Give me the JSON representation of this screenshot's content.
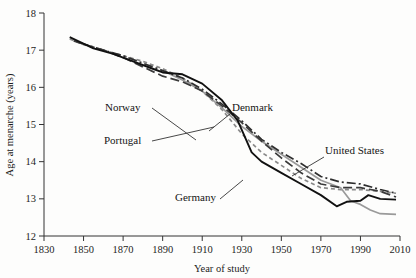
{
  "chart_data": {
    "type": "line",
    "title": "",
    "xlabel": "Year of study",
    "ylabel": "Age at menarche (years)",
    "xlim": [
      1830,
      2010
    ],
    "ylim": [
      12,
      18
    ],
    "xticks": [
      1830,
      1850,
      1870,
      1890,
      1910,
      1930,
      1950,
      1970,
      1990,
      2010
    ],
    "yticks": [
      12,
      13,
      14,
      15,
      16,
      17,
      18
    ],
    "grid": false,
    "legend_position": "inline-annotations",
    "series": [
      {
        "name": "Norway",
        "style": "short-dash",
        "color": "#8a8a8a",
        "label_x": 1870,
        "label_y": 15.05,
        "points": [
          {
            "x": 1843,
            "y": 17.3
          },
          {
            "x": 1850,
            "y": 17.15
          },
          {
            "x": 1860,
            "y": 17.0
          },
          {
            "x": 1870,
            "y": 16.85
          },
          {
            "x": 1880,
            "y": 16.7
          },
          {
            "x": 1890,
            "y": 16.5
          },
          {
            "x": 1900,
            "y": 16.25
          },
          {
            "x": 1910,
            "y": 15.9
          },
          {
            "x": 1920,
            "y": 15.4
          },
          {
            "x": 1930,
            "y": 14.75
          },
          {
            "x": 1940,
            "y": 14.25
          },
          {
            "x": 1950,
            "y": 13.9
          },
          {
            "x": 1960,
            "y": 13.55
          },
          {
            "x": 1970,
            "y": 13.3
          },
          {
            "x": 1980,
            "y": 13.25
          },
          {
            "x": 1990,
            "y": 13.25
          },
          {
            "x": 2000,
            "y": 13.2
          },
          {
            "x": 2008,
            "y": 13.15
          }
        ]
      },
      {
        "name": "Portugal",
        "style": "solid-gray",
        "color": "#9a9a9a",
        "label_x": 1868,
        "label_y": 14.55,
        "points": [
          {
            "x": 1890,
            "y": 16.45
          },
          {
            "x": 1900,
            "y": 16.2
          },
          {
            "x": 1910,
            "y": 15.9
          },
          {
            "x": 1920,
            "y": 15.45
          },
          {
            "x": 1930,
            "y": 14.95
          },
          {
            "x": 1940,
            "y": 14.55
          },
          {
            "x": 1950,
            "y": 14.2
          },
          {
            "x": 1960,
            "y": 13.85
          },
          {
            "x": 1970,
            "y": 13.5
          },
          {
            "x": 1975,
            "y": 13.4
          },
          {
            "x": 1980,
            "y": 13.3
          },
          {
            "x": 1985,
            "y": 12.95
          },
          {
            "x": 1990,
            "y": 12.85
          },
          {
            "x": 1995,
            "y": 12.7
          },
          {
            "x": 2000,
            "y": 12.6
          },
          {
            "x": 2008,
            "y": 12.58
          }
        ]
      },
      {
        "name": "Denmark",
        "style": "dash-dot",
        "color": "#2e2e2e",
        "label_x": 1925,
        "label_y": 15.05,
        "points": [
          {
            "x": 1848,
            "y": 17.2
          },
          {
            "x": 1860,
            "y": 17.0
          },
          {
            "x": 1870,
            "y": 16.85
          },
          {
            "x": 1880,
            "y": 16.65
          },
          {
            "x": 1890,
            "y": 16.45
          },
          {
            "x": 1900,
            "y": 16.25
          },
          {
            "x": 1910,
            "y": 15.95
          },
          {
            "x": 1920,
            "y": 15.55
          },
          {
            "x": 1930,
            "y": 15.1
          },
          {
            "x": 1940,
            "y": 14.6
          },
          {
            "x": 1950,
            "y": 14.25
          },
          {
            "x": 1960,
            "y": 13.95
          },
          {
            "x": 1970,
            "y": 13.6
          },
          {
            "x": 1980,
            "y": 13.45
          },
          {
            "x": 1990,
            "y": 13.4
          },
          {
            "x": 2000,
            "y": 13.25
          },
          {
            "x": 2008,
            "y": 13.15
          }
        ]
      },
      {
        "name": "United States",
        "style": "long-dash",
        "color": "#3a3a3a",
        "label_x": 1975,
        "label_y": 14.3,
        "points": [
          {
            "x": 1845,
            "y": 17.25
          },
          {
            "x": 1860,
            "y": 17.0
          },
          {
            "x": 1870,
            "y": 16.8
          },
          {
            "x": 1880,
            "y": 16.55
          },
          {
            "x": 1890,
            "y": 16.3
          },
          {
            "x": 1900,
            "y": 16.15
          },
          {
            "x": 1910,
            "y": 15.9
          },
          {
            "x": 1920,
            "y": 15.5
          },
          {
            "x": 1930,
            "y": 15.05
          },
          {
            "x": 1940,
            "y": 14.55
          },
          {
            "x": 1950,
            "y": 14.1
          },
          {
            "x": 1960,
            "y": 13.7
          },
          {
            "x": 1970,
            "y": 13.4
          },
          {
            "x": 1980,
            "y": 13.3
          },
          {
            "x": 1990,
            "y": 13.3
          },
          {
            "x": 2000,
            "y": 13.2
          },
          {
            "x": 2008,
            "y": 13.05
          }
        ]
      },
      {
        "name": "Germany",
        "style": "solid-black",
        "color": "#111111",
        "label_x": 1905,
        "label_y": 12.92,
        "points": [
          {
            "x": 1843,
            "y": 17.35
          },
          {
            "x": 1855,
            "y": 17.05
          },
          {
            "x": 1865,
            "y": 16.9
          },
          {
            "x": 1875,
            "y": 16.7
          },
          {
            "x": 1885,
            "y": 16.5
          },
          {
            "x": 1890,
            "y": 16.4
          },
          {
            "x": 1900,
            "y": 16.35
          },
          {
            "x": 1910,
            "y": 16.1
          },
          {
            "x": 1920,
            "y": 15.65
          },
          {
            "x": 1928,
            "y": 15.1
          },
          {
            "x": 1935,
            "y": 14.25
          },
          {
            "x": 1940,
            "y": 14.0
          },
          {
            "x": 1950,
            "y": 13.7
          },
          {
            "x": 1960,
            "y": 13.4
          },
          {
            "x": 1970,
            "y": 13.1
          },
          {
            "x": 1978,
            "y": 12.8
          },
          {
            "x": 1983,
            "y": 12.92
          },
          {
            "x": 1990,
            "y": 12.95
          },
          {
            "x": 1994,
            "y": 13.1
          },
          {
            "x": 2000,
            "y": 13.0
          },
          {
            "x": 2008,
            "y": 12.98
          }
        ]
      }
    ],
    "annotations": [
      {
        "name": "Norway",
        "text_x": 105,
        "text_y": 111,
        "leader": [
          [
            152,
            108
          ],
          [
            196,
            140
          ]
        ]
      },
      {
        "name": "Portugal",
        "text_x": 104,
        "text_y": 144,
        "leader": [
          [
            152,
            141
          ],
          [
            214,
            127
          ]
        ]
      },
      {
        "name": "Denmark",
        "text_x": 232,
        "text_y": 111,
        "leader": [
          [
            230,
            114
          ],
          [
            209,
            131
          ]
        ]
      },
      {
        "name": "United States",
        "text_x": 325,
        "text_y": 154,
        "leader": [
          [
            324,
            157
          ],
          [
            292,
            176
          ]
        ]
      },
      {
        "name": "Germany",
        "text_x": 175,
        "text_y": 201,
        "leader": [
          [
            220,
            199
          ],
          [
            243,
            180
          ]
        ]
      }
    ]
  }
}
